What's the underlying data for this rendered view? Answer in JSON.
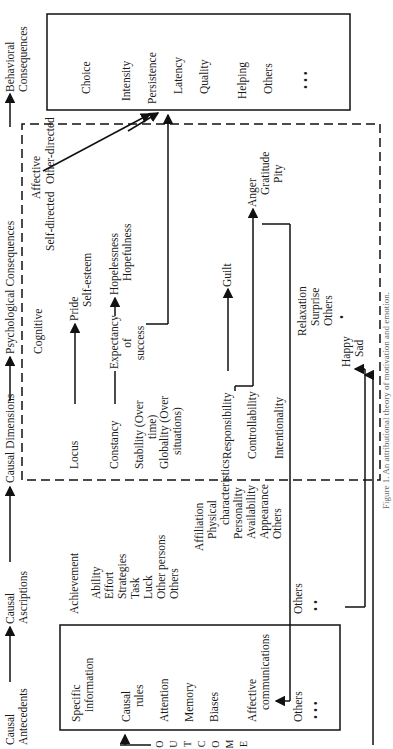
{
  "caption": "Figure 1. An attributional theory of motivation and emotion.",
  "headers": {
    "antecedents": [
      "Causal",
      "Antecedents"
    ],
    "ascriptions": [
      "Causal",
      "Ascriptions"
    ],
    "dimensions": "Causal Dimensions",
    "psychological": "Psychological Consequences",
    "behavioral": [
      "Behavioral",
      "Consequences"
    ]
  },
  "antecedents": {
    "specific": [
      "Specific",
      "information"
    ],
    "rules": [
      "Causal",
      "rules"
    ],
    "attention": "Attention",
    "memory": "Memory",
    "biases": "Biases",
    "affective": [
      "Affective",
      "communications"
    ],
    "others": "Others",
    "dots": "• • •"
  },
  "ascriptions": {
    "achievement": "Achievement",
    "achievement_items": [
      "Ability",
      "Effort",
      "Strategies",
      "Task",
      "Luck",
      "Other persons",
      "Others"
    ],
    "affiliation": "Affiliation",
    "affiliation_items": [
      "Physical",
      "characteristics",
      "Personality",
      "Availability",
      "Appearance",
      "Others"
    ],
    "others": "Others",
    "dots": "• •"
  },
  "dimensions": {
    "locus": "Locus",
    "constancy": "Constancy",
    "stability": [
      "Stability (Over",
      "time)"
    ],
    "globality": [
      "Globality (Over",
      "situations)"
    ],
    "responsibility": "Responsibility",
    "controllability": "Controllability",
    "intentionality": "Intentionality"
  },
  "psychological": {
    "cognitive": "Cognitive",
    "expectancy": [
      "Expectancy",
      "of",
      "success"
    ],
    "affective": "Affective",
    "self_directed": "Self-directed",
    "other_directed": "Other-directed",
    "pride": [
      "Pride",
      "Self-esteem"
    ],
    "hope": [
      "Hopelessness",
      "Hopefulness"
    ],
    "guilt": "Guilt",
    "anger": [
      "Anger",
      "Gratitude",
      "Pity"
    ],
    "misc": [
      "Relaxation",
      "Surprise",
      "Others"
    ],
    "dot": "•",
    "happy_sad": [
      "Happy",
      "Sad"
    ]
  },
  "behavioral": {
    "items": [
      "Choice",
      "Intensity",
      "Persistence",
      "Latency",
      "Quality",
      "Helping",
      "Others"
    ],
    "dots": "• •   •"
  },
  "outcome": [
    "O",
    "U",
    "T",
    "C",
    "O",
    "M",
    "E"
  ]
}
